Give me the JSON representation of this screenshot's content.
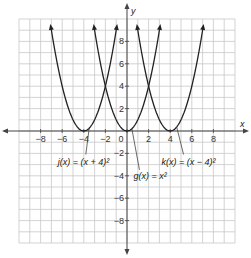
{
  "chart_data": {
    "type": "line",
    "title": "",
    "xlabel": "x",
    "ylabel": "y",
    "xlim": [
      -10,
      10
    ],
    "ylim": [
      -10,
      10
    ],
    "grid": true,
    "x_ticks": [
      -8,
      -6,
      -4,
      -2,
      0,
      2,
      4,
      6,
      8
    ],
    "y_ticks": [
      8,
      6,
      4,
      2,
      -2,
      -4,
      -6,
      -8
    ],
    "x_tick_labels": [
      "−8",
      "−6",
      "−4",
      "−2",
      "0",
      "2",
      "4",
      "6",
      "8"
    ],
    "y_tick_labels": [
      "8",
      "6",
      "4",
      "2",
      "−2",
      "−4",
      "−6",
      "−8"
    ],
    "series": [
      {
        "name": "j",
        "label": "j(x) = (x + 4)²",
        "formula": "(x+4)^2",
        "vertex": [
          -4,
          0
        ],
        "h": -4
      },
      {
        "name": "g",
        "label": "g(x) = x²",
        "formula": "x^2",
        "vertex": [
          0,
          0
        ],
        "h": 0
      },
      {
        "name": "k",
        "label": "k(x) = (x − 4)²",
        "formula": "(x-4)^2",
        "vertex": [
          4,
          0
        ],
        "h": 4
      }
    ],
    "annotations": [
      {
        "text": "j(x) = (x + 4)²",
        "points_to_series": "j",
        "anchor": [
          -4,
          -2.9
        ]
      },
      {
        "text": "g(x) = x²",
        "points_to_series": "g",
        "anchor": [
          0.6,
          -4.1
        ]
      },
      {
        "text": "k(x) = (x − 4)²",
        "points_to_series": "k",
        "anchor": [
          3.2,
          -2.9
        ]
      }
    ]
  }
}
